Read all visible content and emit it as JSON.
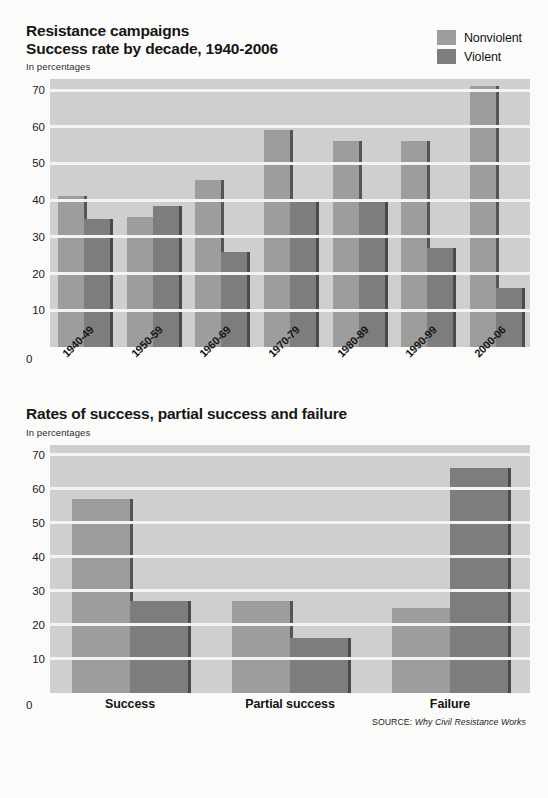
{
  "charts": [
    {
      "title_line1": "Resistance campaigns",
      "title_line2": "Success rate by decade, 1940-2006",
      "subtitle": "In percentages",
      "zero_label": "0",
      "legend": [
        {
          "label": "Nonviolent",
          "color": "#9d9d9d"
        },
        {
          "label": "Violent",
          "color": "#7d7d7d"
        }
      ],
      "chart_data": {
        "type": "bar",
        "title": "Resistance campaigns — Success rate by decade, 1940-2006",
        "subtitle": "In percentages",
        "xlabel": "",
        "ylabel": "In percentages",
        "ylim": [
          0,
          73
        ],
        "yticks": [
          0,
          10,
          20,
          30,
          40,
          50,
          60,
          70
        ],
        "grid": true,
        "legend_position": "top-right",
        "categories": [
          "1940-49",
          "1950-59",
          "1960-69",
          "1970-79",
          "1980-89",
          "1990-99",
          "2000-06"
        ],
        "series": [
          {
            "name": "Nonviolent",
            "color": "#9d9d9d",
            "values": [
              41,
              35.5,
              45.5,
              59,
              56,
              56,
              71
            ]
          },
          {
            "name": "Violent",
            "color": "#7d7d7d",
            "values": [
              35,
              38.5,
              26,
              40,
              40,
              27,
              16
            ]
          }
        ]
      }
    },
    {
      "title_line1": "Rates of success, partial success and failure",
      "title_line2": "",
      "subtitle": "In percentages",
      "zero_label": "0",
      "legend": [],
      "chart_data": {
        "type": "bar",
        "title": "Rates of success, partial success and failure",
        "subtitle": "In percentages",
        "xlabel": "",
        "ylabel": "In percentages",
        "ylim": [
          0,
          73
        ],
        "yticks": [
          0,
          10,
          20,
          30,
          40,
          50,
          60,
          70
        ],
        "grid": true,
        "legend_position": "none",
        "categories": [
          "Success",
          "Partial success",
          "Failure"
        ],
        "series": [
          {
            "name": "Nonviolent",
            "color": "#9d9d9d",
            "values": [
              57,
              27,
              25
            ]
          },
          {
            "name": "Violent",
            "color": "#7d7d7d",
            "values": [
              27,
              16,
              66
            ]
          }
        ]
      }
    }
  ],
  "source": {
    "prefix": "SOURCE: ",
    "work": "Why Civil Resistance Works"
  }
}
